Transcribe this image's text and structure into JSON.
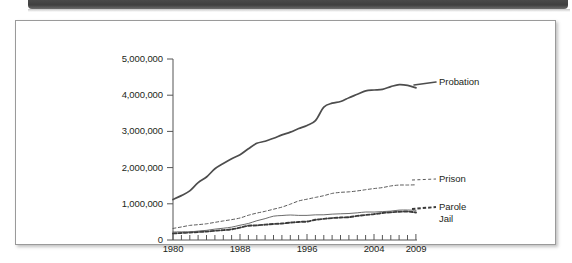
{
  "figure": {
    "top_band": "page-header-band",
    "frame": "chart-frame"
  },
  "chart_data": {
    "type": "line",
    "title": "",
    "subtitle": "",
    "xlabel": "",
    "ylabel": "",
    "grid": false,
    "legend_position": "right-inline-labels",
    "xlim": [
      1980,
      2009
    ],
    "ylim": [
      0,
      5000000
    ],
    "x_ticks_major": [
      "1980",
      "1988",
      "1996",
      "2004",
      "2009"
    ],
    "x_ticks_minor_interval": 1,
    "y_ticks": [
      "0",
      "1,000,000",
      "2,000,000",
      "3,000,000",
      "4,000,000",
      "5,000,000"
    ],
    "y_tick_values": [
      0,
      1000000,
      2000000,
      3000000,
      4000000,
      5000000
    ],
    "x": [
      1980,
      1981,
      1982,
      1983,
      1984,
      1985,
      1986,
      1987,
      1988,
      1989,
      1990,
      1991,
      1992,
      1993,
      1994,
      1995,
      1996,
      1997,
      1998,
      1999,
      2000,
      2001,
      2002,
      2003,
      2004,
      2005,
      2006,
      2007,
      2008,
      2009
    ],
    "series": [
      {
        "name": "Probation",
        "style": "solid-thick",
        "color": "#4d4d4d",
        "label_x": 2009,
        "values": [
          1118097,
          1225934,
          1357264,
          1582947,
          1740948,
          1968712,
          2114621,
          2247158,
          2356483,
          2522125,
          2670234,
          2728472,
          2811611,
          2903061,
          2981022,
          3077861,
          3164996,
          3296513,
          3670441,
          3779922,
          3826209,
          3931731,
          4024067,
          4120012,
          4143792,
          4162536,
          4236800,
          4293163,
          4270917,
          4203967
        ]
      },
      {
        "name": "Prison",
        "style": "dashed-thin",
        "color": "#5a5a5a",
        "label_x": 2009,
        "values": [
          319598,
          360029,
          402914,
          423898,
          448264,
          487593,
          526436,
          562814,
          607766,
          683367,
          743382,
          792535,
          850566,
          909381,
          990147,
          1078542,
          1127528,
          1176564,
          1224469,
          1287172,
          1316333,
          1330007,
          1355748,
          1390279,
          1421345,
          1448344,
          1492973,
          1517867,
          1518559,
          1524513
        ]
      },
      {
        "name": "Parole",
        "style": "solid-thin",
        "color": "#5a5a5a",
        "label_x": 2009,
        "values": [
          220438,
          225539,
          224604,
          246440,
          266992,
          300203,
          325638,
          355505,
          407977,
          456803,
          531407,
          590442,
          658601,
          676100,
          690371,
          679421,
          679733,
          694787,
          696385,
          714457,
          723898,
          732333,
          750934,
          773500,
          771852,
          784408,
          798202,
          826097,
          828169,
          819308
        ]
      },
      {
        "name": "Jail",
        "style": "dashed-thick",
        "color": "#3a3a3a",
        "label_x": 2009,
        "values": [
          182288,
          195085,
          207853,
          221815,
          233018,
          254986,
          272736,
          294092,
          341893,
          393303,
          405320,
          424129,
          441781,
          455500,
          479800,
          499300,
          510400,
          557974,
          584372,
          605943,
          621149,
          631240,
          665475,
          691301,
          713990,
          747529,
          765819,
          780174,
          785533,
          760400
        ]
      }
    ]
  },
  "series_labels": [
    {
      "name": "Probation"
    },
    {
      "name": "Prison"
    },
    {
      "name": "Parole"
    },
    {
      "name": "Jail"
    }
  ]
}
